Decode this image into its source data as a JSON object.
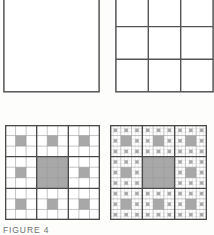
{
  "figure": {
    "caption": "FIGURE 4",
    "colors": {
      "fill_gray": "#a8a8a8",
      "line_dark": "#4a4a4a",
      "line_light": "#8f8f8f",
      "background": "#ffffff",
      "page": "#fdfdfc"
    },
    "panels": [
      {
        "id": "panel-0",
        "name": "sierpinski-carpet-iteration-0",
        "label": "",
        "iteration": 0,
        "grid": 1,
        "description": "Empty outlined square, the initiator of the Sierpinski carpet."
      },
      {
        "id": "panel-1",
        "name": "sierpinski-carpet-iteration-1",
        "label": "",
        "iteration": 1,
        "grid": 3,
        "description": "Square divided into a 3 by 3 grid of nine equal subsquares."
      },
      {
        "id": "panel-2",
        "name": "sierpinski-carpet-iteration-2",
        "label": "",
        "iteration": 2,
        "grid": 9,
        "description": "Nine by nine grid with the central 3 by 3 block filled and the center cell of each surrounding block filled."
      },
      {
        "id": "panel-3",
        "name": "sierpinski-carpet-iteration-3",
        "label": "",
        "iteration": 3,
        "grid": 9,
        "description": "Same nine by nine arrangement with every remaining white cell further subdivided into a 3 by 3 grid with its center filled."
      }
    ]
  },
  "chart_data": {
    "type": "diagram",
    "title": "FIGURE 4",
    "subtitle": "",
    "xlabel": "",
    "ylabel": "",
    "legend": [],
    "grid": true,
    "sequence_name": "Sierpinski carpet construction",
    "iterations": [
      0,
      1,
      2,
      3
    ],
    "grid_divisions": [
      1,
      3,
      9,
      9
    ],
    "filled_color": "#a8a8a8",
    "empty_color": "#ffffff",
    "panel_2_filled_cells": [
      [
        1,
        1
      ],
      [
        1,
        4
      ],
      [
        1,
        7
      ],
      [
        3,
        3
      ],
      [
        3,
        4
      ],
      [
        3,
        5
      ],
      [
        4,
        1
      ],
      [
        4,
        3
      ],
      [
        4,
        4
      ],
      [
        4,
        5
      ],
      [
        4,
        7
      ],
      [
        5,
        3
      ],
      [
        5,
        4
      ],
      [
        5,
        5
      ],
      [
        7,
        1
      ],
      [
        7,
        4
      ],
      [
        7,
        7
      ]
    ],
    "panel_3_filled_cells": [
      [
        1,
        1
      ],
      [
        1,
        4
      ],
      [
        1,
        7
      ],
      [
        3,
        3
      ],
      [
        3,
        4
      ],
      [
        3,
        5
      ],
      [
        4,
        1
      ],
      [
        4,
        3
      ],
      [
        4,
        4
      ],
      [
        4,
        5
      ],
      [
        4,
        7
      ],
      [
        5,
        3
      ],
      [
        5,
        4
      ],
      [
        5,
        5
      ],
      [
        7,
        1
      ],
      [
        7,
        4
      ],
      [
        7,
        7
      ]
    ],
    "panel_3_subdivided": true
  }
}
